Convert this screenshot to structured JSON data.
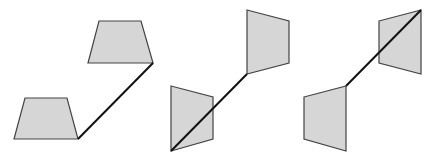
{
  "figure": {
    "colors": {
      "fill": "#d6d6d6",
      "stroke": "#444444",
      "line": "#111111",
      "background": "#ffffff"
    },
    "panels": [
      {
        "name": "panel-1-trapezoids",
        "shapes": [
          "25,98 67,98 78,139 14,139",
          "99,21 141,21 153,63 88,63"
        ],
        "line": [
          78,
          139,
          153,
          63
        ]
      },
      {
        "name": "panel-2-quads",
        "shapes": [
          "171,86 213,97 213,139 171,151",
          "247,10 289,21 289,63 247,74"
        ],
        "line": [
          171,
          151,
          247,
          74
        ]
      },
      {
        "name": "panel-3-quads",
        "shapes": [
          "304,97 346,86 346,151 304,139",
          "379,21 421,10 421,74 379,63"
        ],
        "line": [
          346,
          86,
          421,
          10
        ]
      }
    ]
  }
}
